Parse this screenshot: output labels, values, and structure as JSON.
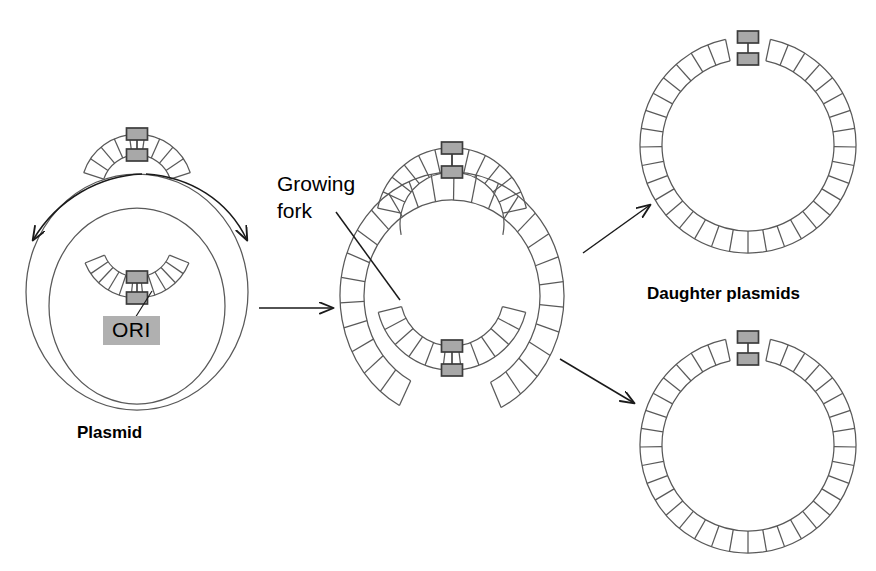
{
  "figure": {
    "title_semantic": "plasmid-theta-replication-diagram",
    "background_color": "#ffffff",
    "line_color": "#595959",
    "arrow_color": "#1a1a1a",
    "marker_fill": "#a8a8a8",
    "marker_stroke": "#3c3c3c",
    "ori_chip_bg": "#b0b0b0"
  },
  "labels": {
    "plasmid": "Plasmid",
    "growing_fork_line1": "Growing",
    "growing_fork_line2": "fork",
    "daughter_plasmids": "Daughter plasmids",
    "ori": "ORI"
  },
  "stages": [
    {
      "id": "parent-plasmid",
      "caption": "Plasmid",
      "description": "Circular plasmid beginning bidirectional replication at ORI",
      "center_x": 137,
      "center_y": 300,
      "rungs": 30
    },
    {
      "id": "theta-intermediate",
      "caption": "Growing fork",
      "description": "Theta replication intermediate with two growing forks",
      "center_x": 452,
      "center_y": 295,
      "rungs": 34
    },
    {
      "id": "daughter-plasmid-top",
      "caption": "Daughter plasmids",
      "description": "Completed daughter plasmid, upper",
      "center_x": 748,
      "center_y": 145,
      "radius": 108,
      "rungs": 36
    },
    {
      "id": "daughter-plasmid-bottom",
      "caption": "Daughter plasmids",
      "description": "Completed daughter plasmid, lower",
      "center_x": 748,
      "center_y": 445,
      "radius": 108,
      "rungs": 36
    }
  ],
  "arrows": [
    {
      "id": "replication-direction-left",
      "kind": "curved",
      "note": "bidirectional replication sweep, left"
    },
    {
      "id": "replication-direction-right",
      "kind": "curved",
      "note": "bidirectional replication sweep, right"
    },
    {
      "id": "stage-arrow-1-to-2",
      "kind": "straight",
      "note": "plasmid to theta intermediate"
    },
    {
      "id": "stage-arrow-2-to-top",
      "kind": "straight",
      "note": "intermediate to upper daughter plasmid"
    },
    {
      "id": "stage-arrow-2-to-bottom",
      "kind": "straight",
      "note": "intermediate to lower daughter plasmid"
    },
    {
      "id": "ori-leader-line",
      "kind": "leader",
      "note": "ORI chip to origin marker"
    },
    {
      "id": "growing-fork-leader-line",
      "kind": "leader",
      "note": "Growing fork text to fork point"
    }
  ],
  "typography": {
    "plasmid_font_size": 17,
    "daughter_font_size": 17,
    "growing_fork_font_size": 21,
    "ori_font_size": 21
  }
}
